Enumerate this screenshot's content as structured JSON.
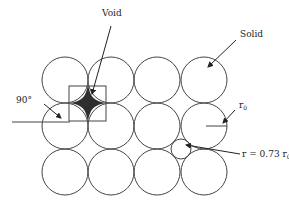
{
  "diagram": {
    "labels": {
      "void": "Void",
      "solid": "Solid",
      "angle": "90°",
      "r0": "r",
      "r0_sub": "0",
      "small_r": "r = 0.73 r",
      "small_r_sub": "0"
    },
    "grid": {
      "rows": 3,
      "cols": 4,
      "radius": 23,
      "col_centers": [
        65,
        111,
        157,
        204
      ],
      "row_centers": [
        80,
        126,
        172
      ]
    },
    "small_circle": {
      "cx": 181,
      "cy": 149,
      "r": 10,
      "ratio": 0.73
    },
    "colors": {
      "stroke": "#444444",
      "void_fill": "#333333",
      "background": "#ffffff"
    }
  }
}
